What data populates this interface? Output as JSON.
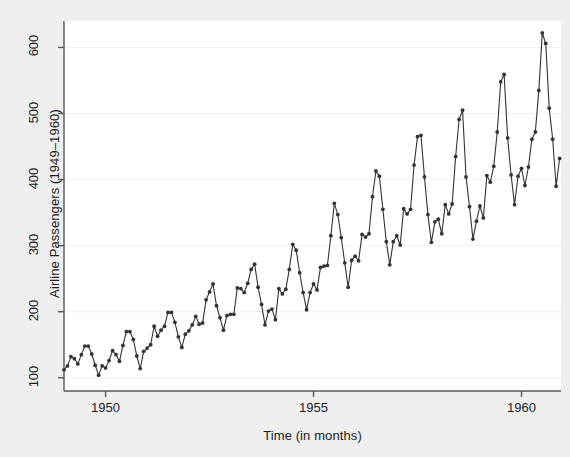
{
  "chart_data": {
    "type": "line",
    "title": "",
    "xlabel": "Time (in months)",
    "ylabel": "Airline Passengers (1949–1960)",
    "xlim": [
      1949.0,
      1960.95
    ],
    "ylim": [
      80,
      640
    ],
    "grid": true,
    "grid_axis": "y",
    "legend": null,
    "legend_position": "none",
    "marker": "circle",
    "marker_color": "#333333",
    "line_color": "#333333",
    "xticks": [
      1950,
      1955,
      1960
    ],
    "xtick_labels": [
      "1950",
      "1955",
      "1960"
    ],
    "yticks": [
      100,
      200,
      300,
      400,
      500,
      600
    ],
    "ytick_labels": [
      "100",
      "200",
      "300",
      "400",
      "500",
      "600"
    ],
    "series": [
      {
        "name": "Airline Passengers",
        "x": [
          1949.0,
          1949.083,
          1949.167,
          1949.25,
          1949.333,
          1949.417,
          1949.5,
          1949.583,
          1949.667,
          1949.75,
          1949.833,
          1949.917,
          1950.0,
          1950.083,
          1950.167,
          1950.25,
          1950.333,
          1950.417,
          1950.5,
          1950.583,
          1950.667,
          1950.75,
          1950.833,
          1950.917,
          1951.0,
          1951.083,
          1951.167,
          1951.25,
          1951.333,
          1951.417,
          1951.5,
          1951.583,
          1951.667,
          1951.75,
          1951.833,
          1951.917,
          1952.0,
          1952.083,
          1952.167,
          1952.25,
          1952.333,
          1952.417,
          1952.5,
          1952.583,
          1952.667,
          1952.75,
          1952.833,
          1952.917,
          1953.0,
          1953.083,
          1953.167,
          1953.25,
          1953.333,
          1953.417,
          1953.5,
          1953.583,
          1953.667,
          1953.75,
          1953.833,
          1953.917,
          1954.0,
          1954.083,
          1954.167,
          1954.25,
          1954.333,
          1954.417,
          1954.5,
          1954.583,
          1954.667,
          1954.75,
          1954.833,
          1954.917,
          1955.0,
          1955.083,
          1955.167,
          1955.25,
          1955.333,
          1955.417,
          1955.5,
          1955.583,
          1955.667,
          1955.75,
          1955.833,
          1955.917,
          1956.0,
          1956.083,
          1956.167,
          1956.25,
          1956.333,
          1956.417,
          1956.5,
          1956.583,
          1956.667,
          1956.75,
          1956.833,
          1956.917,
          1957.0,
          1957.083,
          1957.167,
          1957.25,
          1957.333,
          1957.417,
          1957.5,
          1957.583,
          1957.667,
          1957.75,
          1957.833,
          1957.917,
          1958.0,
          1958.083,
          1958.167,
          1958.25,
          1958.333,
          1958.417,
          1958.5,
          1958.583,
          1958.667,
          1958.75,
          1958.833,
          1958.917,
          1959.0,
          1959.083,
          1959.167,
          1959.25,
          1959.333,
          1959.417,
          1959.5,
          1959.583,
          1959.667,
          1959.75,
          1959.833,
          1959.917,
          1960.0,
          1960.083,
          1960.167,
          1960.25,
          1960.333,
          1960.417,
          1960.5,
          1960.583,
          1960.667,
          1960.75,
          1960.833,
          1960.917
        ],
        "values": [
          112,
          118,
          132,
          129,
          121,
          135,
          148,
          148,
          136,
          119,
          104,
          118,
          115,
          126,
          141,
          135,
          125,
          149,
          170,
          170,
          158,
          133,
          114,
          140,
          145,
          150,
          178,
          163,
          172,
          178,
          199,
          199,
          184,
          162,
          146,
          166,
          171,
          180,
          193,
          181,
          183,
          218,
          230,
          242,
          209,
          191,
          172,
          194,
          196,
          196,
          236,
          235,
          229,
          243,
          264,
          272,
          237,
          211,
          180,
          201,
          204,
          188,
          235,
          227,
          234,
          264,
          302,
          293,
          259,
          229,
          203,
          229,
          242,
          233,
          267,
          269,
          270,
          315,
          364,
          347,
          312,
          274,
          237,
          278,
          284,
          277,
          317,
          313,
          318,
          374,
          413,
          405,
          355,
          306,
          271,
          306,
          315,
          301,
          356,
          348,
          355,
          422,
          465,
          467,
          404,
          347,
          305,
          336,
          340,
          318,
          362,
          348,
          363,
          435,
          491,
          505,
          404,
          359,
          310,
          337,
          360,
          342,
          406,
          396,
          420,
          472,
          548,
          559,
          463,
          407,
          362,
          405,
          417,
          391,
          419,
          461,
          472,
          535,
          622,
          606,
          508,
          461,
          390,
          432
        ]
      }
    ]
  },
  "axes": {
    "y_title": "Airline Passengers (1949–1960)",
    "x_title": "Time (in months)"
  },
  "colors": {
    "page_background": "#efefef",
    "plot_background": "#ffffff",
    "axis": "#55585c",
    "grid": "#f2f2f2",
    "data": "#333333",
    "text": "#1a1a1a"
  }
}
